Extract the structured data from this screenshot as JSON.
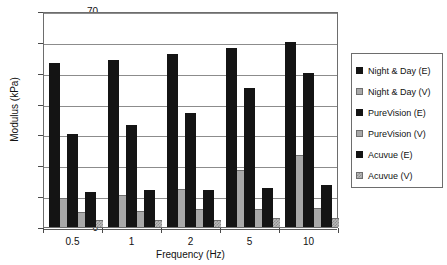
{
  "chart_data": {
    "type": "bar",
    "title": "",
    "xlabel": "Frequency (Hz)",
    "ylabel": "Modulus (kPa)",
    "categories": [
      "0.5",
      "1",
      "2",
      "5",
      "10"
    ],
    "ylim": [
      0,
      70
    ],
    "yticks": [
      0,
      10,
      20,
      30,
      40,
      50,
      60,
      70
    ],
    "grid": true,
    "legend_position": "right",
    "series": [
      {
        "name": "Night & Day (E)",
        "color": "#141414",
        "style": "solid",
        "values": [
          53,
          54,
          56,
          58,
          60
        ]
      },
      {
        "name": "Night & Day (V)",
        "color": "#a8a8a8",
        "style": "solid",
        "values": [
          9,
          10,
          12,
          18,
          23
        ]
      },
      {
        "name": "PureVision (E)",
        "color": "#141414",
        "style": "solid",
        "values": [
          30,
          33,
          37,
          45,
          50
        ]
      },
      {
        "name": "PureVision (V)",
        "color": "#a8a8a8",
        "style": "solid",
        "values": [
          4.5,
          5,
          5.5,
          5.5,
          6
        ]
      },
      {
        "name": "Acuvue (E)",
        "color": "#141414",
        "style": "solid",
        "values": [
          11.5,
          12,
          12,
          12.5,
          13.5
        ]
      },
      {
        "name": "Acuvue (V)",
        "color": "#b9b9b9",
        "style": "hatched",
        "values": [
          2,
          2,
          2,
          2.5,
          2.5
        ]
      }
    ]
  },
  "legend": {
    "items": [
      {
        "label": "Night & Day (E)"
      },
      {
        "label": "Night & Day (V)"
      },
      {
        "label": "PureVision (E)"
      },
      {
        "label": "PureVision (V)"
      },
      {
        "label": "Acuvue (E)"
      },
      {
        "label": "Acuvue (V)"
      }
    ]
  }
}
